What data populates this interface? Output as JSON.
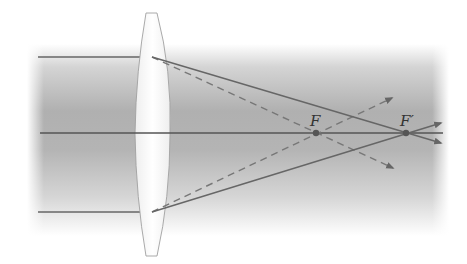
{
  "diagram": {
    "labels": {
      "focal_point": "F",
      "focal_point_prime": "F′"
    },
    "colors": {
      "background": "#ffffff",
      "band_dark": "#a9a9a9",
      "band_light": "#f4f4f4",
      "ray": "#666666",
      "axis": "#555555",
      "lens_outline": "#999999",
      "lens_fill": "#f7f7f7",
      "point": "#555555"
    },
    "elements": {
      "optical_axis": "horizontal principal axis",
      "lens": "biconvex converging lens",
      "incident_rays": 2,
      "solid_refracted_rays": "converge at F′",
      "dashed_rays": "converge at F"
    }
  }
}
